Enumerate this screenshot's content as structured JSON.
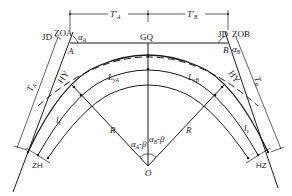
{
  "diagram": {
    "points": {
      "JD_A": "JD",
      "ZOA": "ZOA",
      "JD_B": "JD",
      "ZOB": "ZOB",
      "A": "A",
      "B": "B",
      "GQ": "GQ",
      "HY_left": "HY",
      "HY_right": "HY",
      "ZH": "ZH",
      "HZ": "HZ",
      "O": "O"
    },
    "dimensions": {
      "T_prime_A": {
        "main": "T′",
        "sub": "A"
      },
      "T_prime_B": {
        "main": "T′",
        "sub": "B"
      },
      "T_A": {
        "main": "T",
        "sub": "A"
      },
      "T_B": {
        "main": "T",
        "sub": "B"
      }
    },
    "angles": {
      "alpha_A": {
        "main": "α",
        "sub": "A"
      },
      "alpha_B": {
        "main": "α",
        "sub": "B"
      },
      "alpha_A_minus_beta": {
        "main": "α",
        "sub": "A",
        "rest": "-β"
      },
      "alpha_B_minus_beta": {
        "main": "α",
        "sub": "B",
        "rest": "-β"
      }
    },
    "lengths": {
      "L_yA": {
        "main": "L",
        "sub": "yA"
      },
      "L_yB": {
        "main": "L",
        "sub": "yB"
      },
      "l_s_left": {
        "main": "l",
        "sub": "s"
      },
      "l_s_right": {
        "main": "l",
        "sub": "s"
      }
    },
    "radii": {
      "R_left": "R",
      "R_right": "R"
    }
  }
}
